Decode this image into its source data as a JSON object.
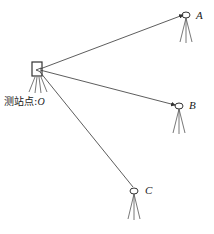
{
  "diagram": {
    "station_label": "测站点:",
    "station_point": "O",
    "targets": [
      {
        "label": "A"
      },
      {
        "label": "B"
      },
      {
        "label": "C"
      }
    ],
    "colors": {
      "line": "#333333",
      "background": "#ffffff"
    }
  }
}
